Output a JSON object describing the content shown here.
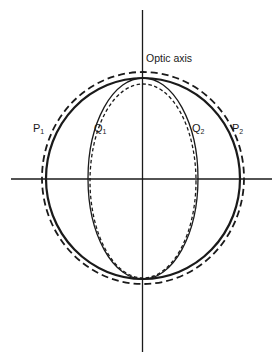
{
  "diagram": {
    "title": "Optic axis",
    "axis_label": "Optic axis",
    "labels": [
      {
        "id": "P1",
        "base": "P",
        "sub": "1"
      },
      {
        "id": "Q1",
        "base": "Q",
        "sub": "1"
      },
      {
        "id": "Q2",
        "base": "Q",
        "sub": "2"
      },
      {
        "id": "P2",
        "base": "P",
        "sub": "2"
      }
    ],
    "curves": [
      {
        "name": "outer-surface-P",
        "style": "solid",
        "shape": "near-circle"
      },
      {
        "name": "outer-surface-P-comparison",
        "style": "long-dash",
        "shape": "circle"
      },
      {
        "name": "inner-surface-Q",
        "style": "solid",
        "shape": "ellipse elongated along optic axis"
      },
      {
        "name": "inner-surface-Q-comparison",
        "style": "short-dash",
        "shape": "ellipse"
      }
    ],
    "colors": {
      "ink": "#1a1a1a",
      "background": "#ffffff"
    }
  }
}
